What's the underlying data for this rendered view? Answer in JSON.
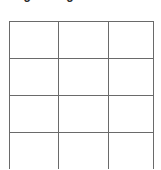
{
  "page": {
    "background_color": "#ffffff",
    "width": 161,
    "height": 169
  },
  "heading": {
    "text": "Organizing",
    "visible_note": "clipped-at-top",
    "color": "#2b2b2b"
  },
  "table": {
    "name": "empty-grid-table",
    "border_color": "#6a6a6a",
    "column_count": 3,
    "row_count": 4,
    "last_row_clipped": true,
    "column_widths": [
      49,
      50,
      45
    ],
    "rows": [
      [
        "",
        "",
        ""
      ],
      [
        "",
        "",
        ""
      ],
      [
        "",
        "",
        ""
      ],
      [
        "",
        "",
        ""
      ]
    ]
  }
}
